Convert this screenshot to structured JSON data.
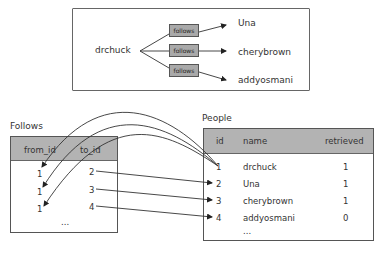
{
  "top_diagram": {
    "source": "drchuck",
    "relation_label": "follows",
    "targets": [
      "Una",
      "cherybrown",
      "addyosmani"
    ]
  },
  "follows_table": {
    "title": "Follows",
    "columns": [
      "from_id",
      "to_id"
    ],
    "rows": [
      {
        "from_id": "1",
        "to_id": "2"
      },
      {
        "from_id": "1",
        "to_id": "3"
      },
      {
        "from_id": "1",
        "to_id": "4"
      }
    ],
    "ellipsis": "..."
  },
  "people_table": {
    "title": "People",
    "columns": [
      "id",
      "name",
      "retrieved"
    ],
    "rows": [
      {
        "id": "1",
        "name": "drchuck",
        "retrieved": "1"
      },
      {
        "id": "2",
        "name": "Una",
        "retrieved": "1"
      },
      {
        "id": "3",
        "name": "cherybrown",
        "retrieved": "1"
      },
      {
        "id": "4",
        "name": "addyosmani",
        "retrieved": "0"
      }
    ],
    "ellipsis": "..."
  },
  "colors": {
    "header_fill": "#b3b3b3",
    "box_fill": "#a9a9a9",
    "line": "#333333"
  }
}
